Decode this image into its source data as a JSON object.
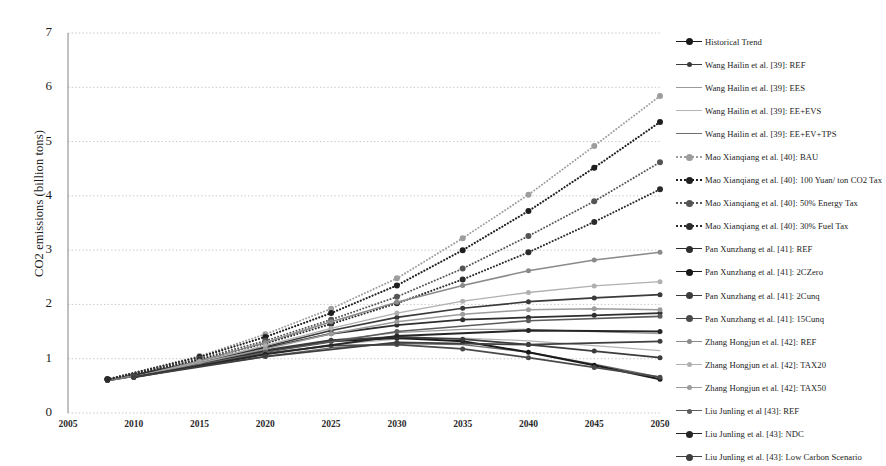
{
  "chart_data": {
    "type": "line",
    "title": "",
    "xlabel": "",
    "ylabel": "CO2 emissions (billion tons)",
    "xlim": [
      2005,
      2050
    ],
    "ylim": [
      0,
      7
    ],
    "ytick_labels": [
      "0",
      "1",
      "2",
      "3",
      "4",
      "5",
      "6",
      "7"
    ],
    "ytick_values": [
      0,
      1,
      2,
      3,
      4,
      5,
      6,
      7
    ],
    "xtick_labels": [
      "2005",
      "2010",
      "2015",
      "2020",
      "2025",
      "2030",
      "2035",
      "2040",
      "2045",
      "2050"
    ],
    "xtick_values": [
      2005,
      2010,
      2015,
      2020,
      2025,
      2030,
      2035,
      2040,
      2045,
      2050
    ],
    "grid": "horizontal-dotted",
    "legend_position": "right",
    "series": [
      {
        "name": "Historical Trend",
        "style": "solid",
        "marker": "circle",
        "color": "#1a1a1a",
        "width": 2.1,
        "x": [
          2008,
          2010,
          2012,
          2015
        ],
        "values": [
          0.6,
          0.68,
          0.78,
          0.92
        ]
      },
      {
        "name": "Wang Hailin et al. [39]: REF",
        "style": "solid",
        "marker": "circle",
        "color": "#3a3a3a",
        "width": 1.7,
        "x": [
          2008,
          2015,
          2020,
          2025,
          2030,
          2035,
          2040,
          2045,
          2050
        ],
        "values": [
          0.6,
          0.95,
          1.22,
          1.52,
          1.76,
          1.93,
          2.05,
          2.12,
          2.18
        ]
      },
      {
        "name": "Wang Hailin et al. [39]: EES",
        "style": "solid",
        "marker": "none",
        "color": "#9a9a9a",
        "width": 1.2,
        "x": [
          2008,
          2015,
          2020,
          2025,
          2030,
          2035,
          2040,
          2045,
          2050
        ],
        "values": [
          0.6,
          0.9,
          1.12,
          1.34,
          1.48,
          1.54,
          1.54,
          1.5,
          1.46
        ]
      },
      {
        "name": "Wang Hailin et al. [39]: EE+EVS",
        "style": "solid",
        "marker": "none",
        "color": "#b4b4b4",
        "width": 1.2,
        "x": [
          2008,
          2015,
          2020,
          2025,
          2030,
          2035,
          2040,
          2045,
          2050
        ],
        "values": [
          0.6,
          0.88,
          1.08,
          1.26,
          1.36,
          1.38,
          1.33,
          1.24,
          1.15
        ]
      },
      {
        "name": "Wang Hailin et al. [39]: EE+EV+TPS",
        "style": "solid",
        "marker": "none",
        "color": "#6e6e6e",
        "width": 1.4,
        "x": [
          2008,
          2015,
          2020,
          2025,
          2030,
          2035,
          2040,
          2045,
          2050
        ],
        "values": [
          0.6,
          0.86,
          1.04,
          1.2,
          1.28,
          1.26,
          1.12,
          0.9,
          0.66
        ]
      },
      {
        "name": "Mao Xianqiang et al. [40]: BAU",
        "style": "dotted",
        "marker": "circle",
        "color": "#9d9d9d",
        "width": 1.9,
        "x": [
          2008,
          2015,
          2020,
          2025,
          2030,
          2035,
          2040,
          2045,
          2050
        ],
        "values": [
          0.62,
          1.05,
          1.45,
          1.92,
          2.48,
          3.22,
          4.02,
          4.92,
          5.84
        ]
      },
      {
        "name": "Mao Xianqiang et al. [40]: 100 Yuan/ ton CO2 Tax",
        "style": "dotted",
        "marker": "circle",
        "color": "#1f1f1f",
        "width": 2.1,
        "x": [
          2008,
          2015,
          2020,
          2025,
          2030,
          2035,
          2040,
          2045,
          2050
        ],
        "values": [
          0.62,
          1.03,
          1.4,
          1.84,
          2.35,
          3.0,
          3.72,
          4.52,
          5.36
        ]
      },
      {
        "name": "Mao Xianqiang et al. [40]: 50% Energy Tax",
        "style": "dotted",
        "marker": "circle",
        "color": "#555555",
        "width": 1.9,
        "x": [
          2008,
          2015,
          2020,
          2025,
          2030,
          2035,
          2040,
          2045,
          2050
        ],
        "values": [
          0.62,
          1.0,
          1.33,
          1.72,
          2.14,
          2.66,
          3.26,
          3.9,
          4.62
        ]
      },
      {
        "name": "Mao Xianqiang et al. [40]: 30% Fuel Tax",
        "style": "dotted",
        "marker": "circle",
        "color": "#2b2b2b",
        "width": 2.0,
        "x": [
          2008,
          2015,
          2020,
          2025,
          2030,
          2035,
          2040,
          2045,
          2050
        ],
        "values": [
          0.62,
          0.98,
          1.28,
          1.64,
          2.02,
          2.46,
          2.96,
          3.52,
          4.12
        ]
      },
      {
        "name": "Pan Xunzhang et al. [41]: REF",
        "style": "solid",
        "marker": "circle",
        "color": "#2e2e2e",
        "width": 1.8,
        "x": [
          2010,
          2020,
          2025,
          2030,
          2035,
          2040,
          2045,
          2050
        ],
        "values": [
          0.68,
          1.2,
          1.46,
          1.62,
          1.72,
          1.76,
          1.8,
          1.84
        ]
      },
      {
        "name": "Pan Xunzhang et al. [41]: 2CZero",
        "style": "solid",
        "marker": "circle",
        "color": "#1a1a1a",
        "width": 2.0,
        "x": [
          2010,
          2020,
          2025,
          2030,
          2035,
          2040,
          2045,
          2050
        ],
        "values": [
          0.68,
          1.14,
          1.32,
          1.38,
          1.32,
          1.12,
          0.88,
          0.62
        ]
      },
      {
        "name": "Pan Xunzhang et al. [41]: 2Cunq",
        "style": "solid",
        "marker": "circle",
        "color": "#3c3c3c",
        "width": 1.8,
        "x": [
          2010,
          2020,
          2025,
          2030,
          2035,
          2040,
          2045,
          2050
        ],
        "values": [
          0.68,
          1.16,
          1.34,
          1.4,
          1.36,
          1.26,
          1.14,
          1.02
        ]
      },
      {
        "name": "Pan Xunzhang et al. [41]: 15Cunq",
        "style": "solid",
        "marker": "circle",
        "color": "#4a4a4a",
        "width": 1.8,
        "x": [
          2010,
          2020,
          2025,
          2030,
          2035,
          2040,
          2045,
          2050
        ],
        "values": [
          0.68,
          1.1,
          1.24,
          1.26,
          1.18,
          1.02,
          0.84,
          0.66
        ]
      },
      {
        "name": "Zhang Hongjun et al. [42]: REF",
        "style": "solid",
        "marker": "circle",
        "color": "#8a8a8a",
        "width": 1.5,
        "x": [
          2010,
          2015,
          2020,
          2025,
          2030,
          2035,
          2040,
          2045,
          2050
        ],
        "values": [
          0.66,
          0.96,
          1.3,
          1.68,
          2.04,
          2.35,
          2.62,
          2.82,
          2.96
        ]
      },
      {
        "name": "Zhang Hongjun et al. [42]: TAX20",
        "style": "solid",
        "marker": "circle",
        "color": "#b0b0b0",
        "width": 1.3,
        "x": [
          2010,
          2015,
          2020,
          2025,
          2030,
          2035,
          2040,
          2045,
          2050
        ],
        "values": [
          0.66,
          0.94,
          1.24,
          1.56,
          1.84,
          2.06,
          2.22,
          2.34,
          2.42
        ]
      },
      {
        "name": "Zhang Hongjun et al. [42]: TAX50",
        "style": "solid",
        "marker": "circle",
        "color": "#9c9c9c",
        "width": 1.5,
        "x": [
          2010,
          2015,
          2020,
          2025,
          2030,
          2035,
          2040,
          2045,
          2050
        ],
        "values": [
          0.66,
          0.92,
          1.18,
          1.46,
          1.68,
          1.82,
          1.9,
          1.92,
          1.9
        ]
      },
      {
        "name": "Liu Junling et al [43]:  REF",
        "style": "solid",
        "marker": "circle",
        "color": "#5c5c5c",
        "width": 1.6,
        "x": [
          2010,
          2020,
          2030,
          2040,
          2050
        ],
        "values": [
          0.66,
          1.12,
          1.5,
          1.7,
          1.78
        ]
      },
      {
        "name": "Liu Junling et al. [43]:  NDC",
        "style": "solid",
        "marker": "circle",
        "color": "#262626",
        "width": 2.0,
        "x": [
          2010,
          2020,
          2030,
          2040,
          2050
        ],
        "values": [
          0.66,
          1.08,
          1.42,
          1.52,
          1.5
        ]
      },
      {
        "name": "Liu Junling et al. [43]:  Low Carbon Scenario",
        "style": "solid",
        "marker": "circle",
        "color": "#3f3f3f",
        "width": 1.8,
        "x": [
          2010,
          2020,
          2030,
          2040,
          2050
        ],
        "values": [
          0.66,
          1.04,
          1.3,
          1.26,
          1.32
        ]
      }
    ]
  }
}
